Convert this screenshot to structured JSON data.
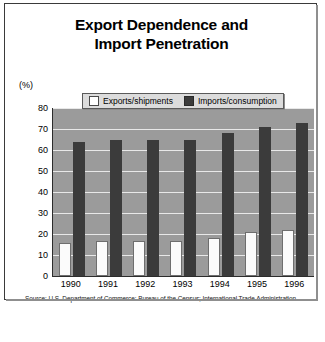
{
  "figure": {
    "title_line1": "Export Dependence and",
    "title_line2": "Import Penetration",
    "unit_label": "(%)",
    "source": "Source: U.S. Department of Commerce: Bureau of the Census; International Trade Administration."
  },
  "legend": {
    "exports_label": "Exports/shipments",
    "imports_label": "Imports/consumption"
  },
  "colors": {
    "exports_bar": "#fbfbfb",
    "imports_bar": "#3b3b3b",
    "plot_background": "#9b9b9b",
    "gridline": "#e8e8e8",
    "frame": "#3a3a3a",
    "legend_background": "#dcdcdc"
  },
  "chart_data": {
    "type": "bar",
    "title": "Export Dependence and Import Penetration",
    "xlabel": "",
    "ylabel": "(%)",
    "ylim": [
      0,
      80
    ],
    "yticks": [
      0,
      10,
      20,
      30,
      40,
      50,
      60,
      70,
      80
    ],
    "grid": true,
    "legend_position": "top-center",
    "categories": [
      "1990",
      "1991",
      "1992",
      "1993",
      "1994",
      "1995",
      "1996"
    ],
    "series": [
      {
        "name": "Exports/shipments",
        "color": "#fbfbfb",
        "values": [
          15.5,
          16.5,
          16.5,
          16.5,
          18,
          21,
          22
        ]
      },
      {
        "name": "Imports/consumption",
        "color": "#3b3b3b",
        "values": [
          64,
          65,
          65,
          65,
          68,
          71,
          73
        ]
      }
    ],
    "annotations": [
      "Source: U.S. Department of Commerce: Bureau of the Census; International Trade Administration."
    ]
  }
}
